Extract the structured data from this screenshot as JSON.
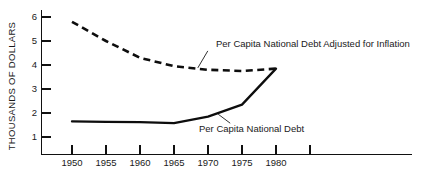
{
  "chart_data": {
    "type": "line",
    "title": "",
    "xlabel": "",
    "ylabel": "THOUSANDS OF DOLLARS",
    "xlim": [
      1948,
      1987
    ],
    "ylim": [
      0,
      6.4
    ],
    "grid": false,
    "legend_position": "inline-annotations",
    "x_tick_labels": [
      "1950",
      "1955",
      "1960",
      "1965",
      "1970",
      "1975",
      "1980"
    ],
    "x_ticks": [
      1950,
      1955,
      1960,
      1965,
      1970,
      1975,
      1980,
      1985
    ],
    "x_unlabeled_ticks": [
      1985
    ],
    "y_tick_labels": [
      "1",
      "2",
      "3",
      "4",
      "5",
      "6"
    ],
    "y_ticks": [
      1,
      2,
      3,
      4,
      5,
      6
    ],
    "series": [
      {
        "name": "Per Capita National Debt Adjusted for Inflation",
        "style": "dashed",
        "x": [
          1950,
          1955,
          1960,
          1965,
          1970,
          1975,
          1980
        ],
        "values": [
          5.8,
          5.0,
          4.3,
          3.95,
          3.8,
          3.75,
          3.85
        ]
      },
      {
        "name": "Per Capita National Debt",
        "style": "solid",
        "x": [
          1950,
          1955,
          1960,
          1965,
          1970,
          1975,
          1980
        ],
        "values": [
          1.65,
          1.63,
          1.62,
          1.58,
          1.85,
          2.35,
          3.85
        ]
      }
    ],
    "annotations": [
      {
        "text": "Per Capita National Debt Adjusted for Inflation",
        "target_x": 1968.5,
        "target_y": 3.88
      },
      {
        "text": "Per Capita National Debt",
        "target_x": 1971.5,
        "target_y": 1.95
      }
    ]
  },
  "colors": {
    "ink": "#0d0d0d",
    "axis": "#111111",
    "background": "#ffffff"
  }
}
